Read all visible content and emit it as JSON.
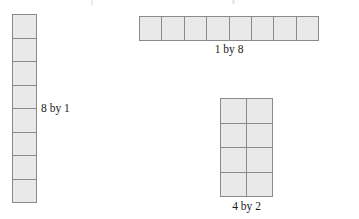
{
  "page": {
    "background_color": "#ffffff",
    "cell_fill_color": "#e9e9e9",
    "cell_border_color": "#8a8a8a",
    "label_color": "#1a1a1a"
  },
  "figures": [
    {
      "id": "8by1",
      "label": "8 by 1",
      "label_position": "right",
      "rows": 8,
      "cols": 1,
      "cell_count": 8
    },
    {
      "id": "1by8",
      "label": "1 by 8",
      "label_position": "below",
      "rows": 1,
      "cols": 8,
      "cell_count": 8
    },
    {
      "id": "4by2",
      "label": "4 by 2",
      "label_position": "below",
      "rows": 4,
      "cols": 2,
      "cell_count": 8
    }
  ]
}
